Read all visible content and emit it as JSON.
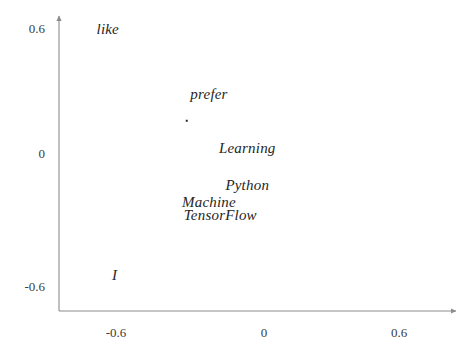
{
  "chart_data": {
    "type": "scatter",
    "title": "",
    "subtitle": "",
    "xlabel": "",
    "ylabel": "",
    "xlim": [
      -0.82,
      0.92
    ],
    "ylim": [
      -0.73,
      0.73
    ],
    "xticks": [
      "-0.6",
      "0",
      "0.6"
    ],
    "xtick_values": [
      -0.6,
      0,
      0.6
    ],
    "yticks": [
      "0.6",
      "0",
      "-0.6"
    ],
    "ytick_values": [
      0.6,
      0,
      -0.6
    ],
    "grid": false,
    "legend": null,
    "axis_style": "arrow-spines",
    "marker_color": "#2b2b2b",
    "text_color": "#262626",
    "axis_color": "#8c8c8c",
    "background": "#ffffff",
    "points": [
      {
        "label": "like",
        "x": -0.69,
        "y": 0.59,
        "marker_visible": false
      },
      {
        "label": "prefer",
        "x": -0.24,
        "y": 0.28,
        "marker_visible": false
      },
      {
        "label": "",
        "x": -0.34,
        "y": 0.15,
        "marker_visible": true
      },
      {
        "label": "Learning",
        "x": -0.07,
        "y": 0.02,
        "marker_visible": false
      },
      {
        "label": "Python",
        "x": -0.07,
        "y": -0.16,
        "marker_visible": false
      },
      {
        "label": "Machine",
        "x": -0.24,
        "y": -0.24,
        "marker_visible": false
      },
      {
        "label": "TensorFlow",
        "x": -0.19,
        "y": -0.3,
        "marker_visible": false
      },
      {
        "label": "I",
        "x": -0.66,
        "y": -0.59,
        "marker_visible": false
      }
    ]
  },
  "axes": {
    "x_tick_labels": [
      "-0.6",
      "0",
      "0.6"
    ],
    "y_tick_labels": [
      "0.6",
      "0",
      "-0.6"
    ]
  }
}
